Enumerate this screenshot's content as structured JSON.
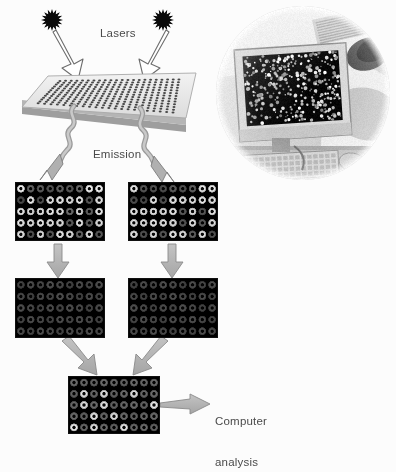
{
  "figure": {
    "background_color": "#fcfcfc",
    "width": 396,
    "height": 446
  },
  "labels": {
    "lasers": "Lasers",
    "emission": "Emission",
    "computer_analysis_line1": "Computer",
    "computer_analysis_line2": "analysis",
    "text_color": "#4a4a4a"
  },
  "lasers": [
    {
      "name": "laser-left",
      "x": 52,
      "y": 20,
      "color": "#0a0a0a",
      "spikes": 16,
      "radius": 11
    },
    {
      "name": "laser-right",
      "x": 163,
      "y": 20,
      "color": "#0a0a0a",
      "spikes": 16,
      "radius": 11
    }
  ],
  "laser_beams": [
    {
      "name": "beam-left",
      "from_x": 58,
      "from_y": 28,
      "to_x": 78,
      "to_y": 72
    },
    {
      "name": "beam-right",
      "from_x": 160,
      "from_y": 28,
      "to_x": 143,
      "to_y": 72
    }
  ],
  "slide": {
    "name": "microarray-slide",
    "fill": "#e8e8e8",
    "edge": "#9a9a9a",
    "spot_color": "#2a2a2a",
    "spot_rows": 13,
    "spot_cols": 22,
    "comment": "light grey parallelogram chip bearing a dense printed spot grid"
  },
  "emission_squiggles": [
    {
      "name": "emission-left",
      "start_x": 72,
      "start_y": 112,
      "end_x": 44,
      "end_y": 168
    },
    {
      "name": "emission-right",
      "start_x": 140,
      "start_y": 112,
      "end_x": 170,
      "end_y": 168
    }
  ],
  "arrows": [
    {
      "name": "arrow-left-top-to-mid",
      "from_x": 58,
      "from_y": 243,
      "to_x": 58,
      "to_y": 276,
      "style": "straight-down"
    },
    {
      "name": "arrow-right-top-to-mid",
      "from_x": 172,
      "from_y": 243,
      "to_x": 172,
      "to_y": 276,
      "style": "straight-down"
    },
    {
      "name": "arrow-left-mid-to-merge",
      "from_x": 64,
      "from_y": 341,
      "to_x": 98,
      "to_y": 373,
      "style": "diagonal"
    },
    {
      "name": "arrow-right-mid-to-merge",
      "from_x": 166,
      "from_y": 341,
      "to_x": 133,
      "to_y": 373,
      "style": "diagonal"
    },
    {
      "name": "arrow-merge-to-computer",
      "from_x": 160,
      "from_y": 405,
      "to_x": 208,
      "to_y": 405,
      "style": "straight-right"
    }
  ],
  "arrow_style": {
    "fill": "#b3b3b3",
    "stroke": "#6e6e6e"
  },
  "panels": [
    {
      "name": "panel-scan-left",
      "label": "left channel raw scan",
      "x": 15,
      "y": 182,
      "width": 90,
      "height": 59,
      "cols": 9,
      "rows": 5,
      "intensities": [
        [
          1.0,
          0.42,
          0.38,
          0.34,
          0.4,
          0.36,
          0.44,
          1.0,
          1.0
        ],
        [
          0.3,
          0.95,
          0.32,
          0.92,
          0.95,
          0.9,
          0.94,
          0.36,
          0.92
        ],
        [
          0.95,
          0.9,
          0.94,
          0.96,
          0.92,
          0.45,
          0.9,
          0.4,
          0.95
        ],
        [
          0.94,
          0.9,
          0.95,
          0.92,
          0.9,
          0.38,
          0.94,
          0.4,
          0.9
        ],
        [
          0.92,
          0.34,
          0.9,
          0.36,
          0.95,
          0.9,
          0.42,
          0.94,
          0.36
        ]
      ]
    },
    {
      "name": "panel-scan-right",
      "label": "right channel raw scan",
      "x": 128,
      "y": 182,
      "width": 90,
      "height": 59,
      "cols": 9,
      "rows": 5,
      "intensities": [
        [
          0.95,
          0.36,
          0.34,
          0.32,
          0.38,
          0.34,
          0.4,
          0.95,
          0.96
        ],
        [
          0.32,
          0.3,
          0.92,
          0.34,
          0.94,
          0.92,
          0.9,
          0.95,
          0.92
        ],
        [
          0.94,
          0.92,
          0.95,
          0.9,
          0.94,
          0.38,
          0.92,
          0.36,
          0.94
        ],
        [
          0.92,
          0.9,
          0.94,
          0.92,
          0.9,
          0.36,
          0.92,
          0.38,
          0.9
        ],
        [
          0.92,
          0.34,
          0.9,
          0.36,
          0.94,
          0.9,
          0.4,
          0.92,
          0.34
        ]
      ]
    },
    {
      "name": "panel-normalized-left",
      "label": "left channel normalized grid",
      "x": 15,
      "y": 278,
      "width": 90,
      "height": 60,
      "cols": 9,
      "rows": 5,
      "uniform_intensity": 0.3
    },
    {
      "name": "panel-normalized-right",
      "label": "right channel normalized grid",
      "x": 128,
      "y": 278,
      "width": 90,
      "height": 60,
      "cols": 9,
      "rows": 5,
      "uniform_intensity": 0.3
    },
    {
      "name": "panel-merged",
      "label": "merged composite array",
      "x": 68,
      "y": 376,
      "width": 92,
      "height": 58,
      "cols": 9,
      "rows": 5,
      "intensities": [
        [
          0.44,
          0.42,
          0.4,
          0.44,
          0.42,
          0.4,
          0.44,
          0.42,
          0.44
        ],
        [
          0.4,
          0.92,
          0.42,
          0.9,
          0.4,
          0.44,
          0.9,
          0.42,
          0.44
        ],
        [
          0.42,
          0.9,
          0.44,
          0.92,
          0.4,
          0.42,
          0.44,
          0.4,
          0.95
        ],
        [
          0.44,
          0.4,
          0.92,
          0.42,
          0.9,
          0.44,
          0.4,
          0.42,
          0.44
        ],
        [
          0.95,
          0.42,
          0.9,
          0.44,
          0.4,
          0.92,
          0.42,
          0.44,
          0.4
        ]
      ]
    }
  ],
  "photo": {
    "name": "lab-photograph",
    "description": "circular vignette photograph of a researcher viewing a microarray scan on a CRT monitor",
    "x": 216,
    "y": 6,
    "diameter": 174,
    "elements": {
      "monitor_screen": "black screen with scattered bright microarray spots",
      "keyboard": "keyboard at lower area",
      "researcher": "person in white coat at right"
    }
  }
}
